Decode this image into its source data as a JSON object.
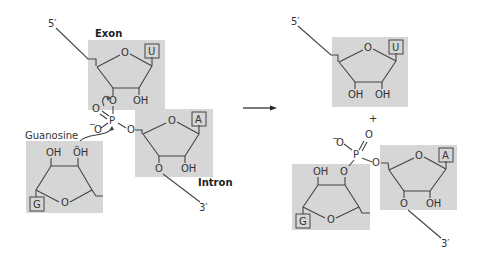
{
  "diagram": {
    "title": "",
    "reactant": {
      "strand_5prime_label": "5′",
      "strand_3prime_label": "3′",
      "exon_label": "Exon",
      "intron_label": "Intron",
      "guanosine_label": "Guanosine",
      "exon_base": "U",
      "intron_base": "A",
      "guanosine_base": "G",
      "ring_oxygen": "O",
      "hydroxyl": "OH",
      "phosphorus": "P",
      "phosphate_oxygen": "O",
      "phosphate_double_o": "O",
      "phosphate_negative_o": "O",
      "minus": "−",
      "lone_pair_oh": "ÖH"
    },
    "arrow": "reaction-arrow",
    "product": {
      "strand_5prime_label": "5′",
      "strand_3prime_label": "3′",
      "plus": "+",
      "exon_base": "U",
      "intron_base": "A",
      "guanosine_base": "G",
      "ring_oxygen": "O",
      "hydroxyl": "OH",
      "phosphorus": "P",
      "phosphate_oxygen": "O",
      "minus": "−"
    },
    "colors": {
      "sugar_shade": "#d6d6d6",
      "line": "#444444",
      "text": "#333333"
    }
  }
}
